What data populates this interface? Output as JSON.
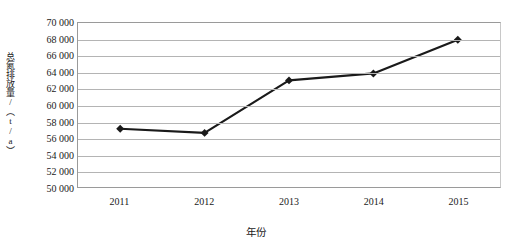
{
  "chart_data": {
    "type": "line",
    "title": "",
    "xlabel": "年份",
    "ylabel": "总氮排放量/（t/a）",
    "categories": [
      "2011",
      "2012",
      "2013",
      "2014",
      "2015"
    ],
    "values": [
      57100,
      56600,
      63000,
      63850,
      67950
    ],
    "series": [
      {
        "name": "总氮排放量",
        "values": [
          57100,
          56600,
          63000,
          63850,
          67950
        ]
      }
    ],
    "ylim": [
      50000,
      70000
    ],
    "ytick_step": 2000,
    "ytick_labels": [
      "70 000",
      "68 000",
      "66 000",
      "64 000",
      "62 000",
      "60 000",
      "58 000",
      "56 000",
      "54 000",
      "52 000",
      "50 000"
    ],
    "ytick_values": [
      70000,
      68000,
      66000,
      64000,
      62000,
      60000,
      58000,
      56000,
      54000,
      52000,
      50000
    ],
    "grid": true,
    "legend": false,
    "legend_position": "none",
    "marker": "diamond",
    "line_color": "#1a1a1a",
    "marker_color": "#1a1a1a",
    "grid_color": "#b4b4b4",
    "plot_border_color": "#9a9a9a",
    "background": "#ffffff"
  }
}
